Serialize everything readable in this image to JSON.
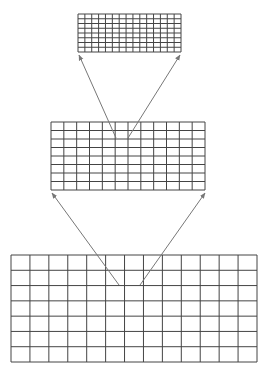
{
  "diagram": {
    "type": "image-pyramid",
    "colors": {
      "grid_line": "#444444",
      "arrow": "#777777",
      "background": "#ffffff"
    },
    "levels": [
      {
        "name": "level-top",
        "x": 78,
        "y": 14,
        "width": 103,
        "height": 38,
        "cols": 15,
        "rows": 8
      },
      {
        "name": "level-middle",
        "x": 51,
        "y": 122,
        "width": 154,
        "height": 68,
        "cols": 12,
        "rows": 8
      },
      {
        "name": "level-bottom",
        "x": 11,
        "y": 255,
        "width": 246,
        "height": 107,
        "cols": 13,
        "rows": 7
      }
    ],
    "arrows": [
      {
        "name": "arrow-middle-to-top-left",
        "x1": 116,
        "y1": 138,
        "x2": 79,
        "y2": 55
      },
      {
        "name": "arrow-middle-to-top-right",
        "x1": 128,
        "y1": 138,
        "x2": 180,
        "y2": 55
      },
      {
        "name": "arrow-bottom-to-middle-left",
        "x1": 119,
        "y1": 285,
        "x2": 52,
        "y2": 193
      },
      {
        "name": "arrow-bottom-to-middle-right",
        "x1": 140,
        "y1": 285,
        "x2": 205,
        "y2": 193
      }
    ]
  }
}
